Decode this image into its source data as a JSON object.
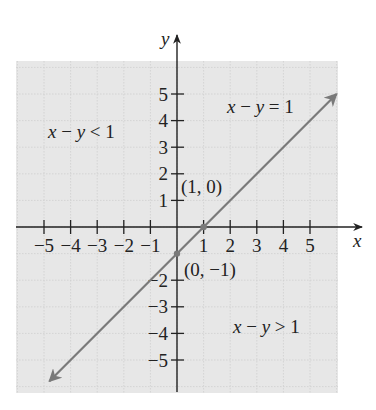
{
  "chart_data": {
    "type": "line",
    "title": "",
    "xlabel": "x",
    "ylabel": "y",
    "xlim": [
      -6,
      6.3
    ],
    "ylim": [
      -6.2,
      7.2
    ],
    "grid": true,
    "shaded_background": true,
    "x_ticks": [
      -5,
      -4,
      -3,
      -2,
      -1,
      1,
      2,
      3,
      4,
      5
    ],
    "y_ticks": [
      5,
      4,
      3,
      2,
      1,
      -2,
      -3,
      -4,
      -5
    ],
    "x_tick_labels": [
      "−5",
      "−4",
      "−3",
      "−2",
      "−1",
      "1",
      "2",
      "3",
      "4",
      "5"
    ],
    "y_tick_labels": [
      "5",
      "4",
      "3",
      "2",
      "1",
      "−2",
      "−3",
      "−4",
      "−5"
    ],
    "series": [
      {
        "name": "x − y = 1",
        "equation": "y = x - 1",
        "style": "solid line with arrows at both ends",
        "color": "#7a7a7a",
        "x": [
          -4.8,
          6.0
        ],
        "y": [
          -5.8,
          5.0
        ]
      }
    ],
    "points": [
      {
        "label": "(1, 0)",
        "x": 1,
        "y": 0
      },
      {
        "label": "(0, −1)",
        "x": 0,
        "y": -1
      }
    ],
    "annotations": [
      {
        "text": "x − y = 1",
        "x": 2.7,
        "y": 4.4
      },
      {
        "text": "x − y < 1",
        "x": -4.9,
        "y": 3.5
      },
      {
        "text": "x − y > 1",
        "x": 2.1,
        "y": -3.9
      }
    ]
  },
  "labels": {
    "x_axis": "x",
    "y_axis": "y",
    "line_eq": "x − y = 1",
    "region_less": "x − y < 1",
    "region_greater": "x − y > 1",
    "point_a": "(1, 0)",
    "point_b": "(0, −1)"
  },
  "colors": {
    "shade": "#e7e7e7",
    "grid": "#cfcfcf",
    "axis": "#222222",
    "line": "#7a7a7a"
  }
}
